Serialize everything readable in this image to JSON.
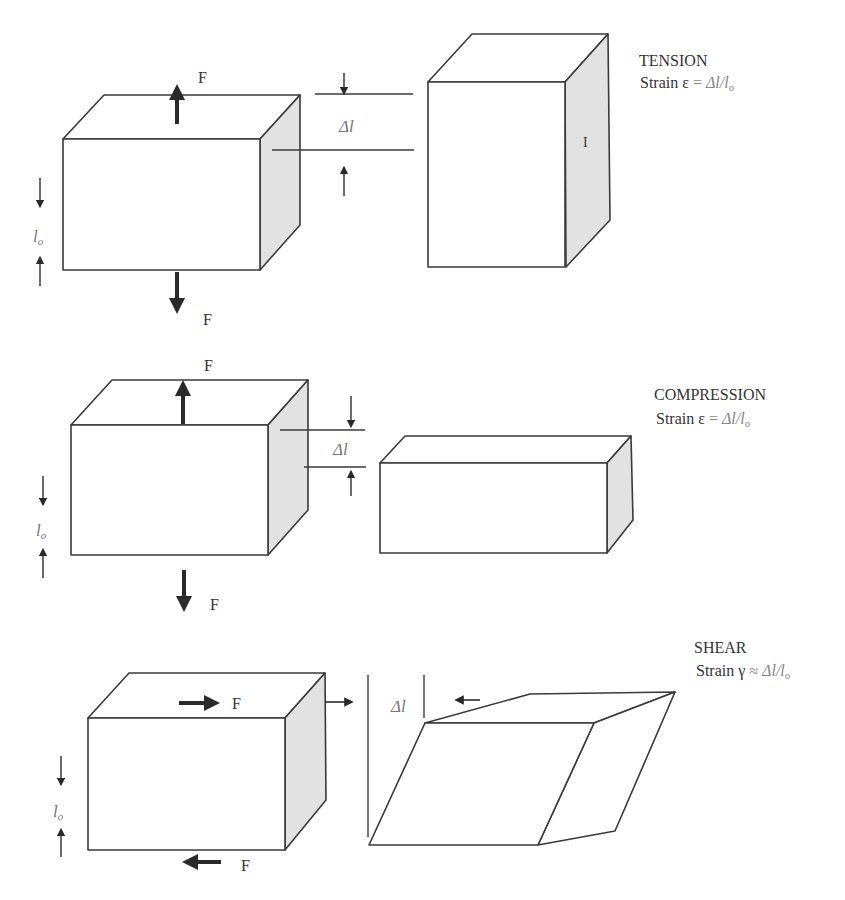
{
  "sections": {
    "tension": {
      "title": "TENSION",
      "strain_label": "Strain",
      "strain_symbol": "ε",
      "relation": "=",
      "formula": "Δl/l",
      "subscript": "o",
      "force_label_top": "F",
      "force_label_bottom": "F",
      "delta_label": "Δl",
      "length_label": "l",
      "length_subscript": "o",
      "side_mark": "I"
    },
    "compression": {
      "title": "COMPRESSION",
      "strain_label": "Strain",
      "strain_symbol": "ε",
      "relation": "=",
      "formula": "Δl/l",
      "subscript": "o",
      "force_label_top": "F",
      "force_label_bottom": "F",
      "delta_label": "Δl",
      "length_label": "l",
      "length_subscript": "o"
    },
    "shear": {
      "title": "SHEAR",
      "strain_label": "Strain",
      "strain_symbol": "γ",
      "relation": "≈",
      "formula": "Δl/l",
      "subscript": "o",
      "force_label_top": "F",
      "force_label_bottom": "F",
      "delta_label": "Δl",
      "length_label": "l",
      "length_subscript": "o"
    }
  },
  "colors": {
    "line": "#3a3a3a",
    "shaded_face": "#e2e2e2",
    "background": "#ffffff"
  }
}
